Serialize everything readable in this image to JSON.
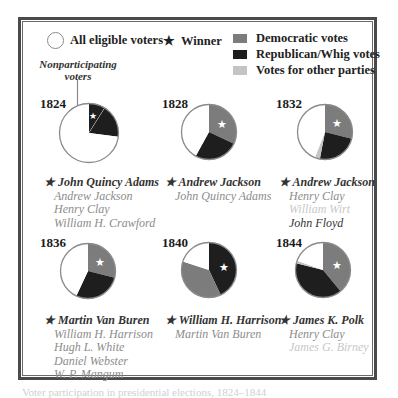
{
  "legend": {
    "eligible": "All eligible voters",
    "winner": "Winner",
    "democratic": "Democratic votes",
    "republican": "Republican/Whig votes",
    "other": "Votes for other parties"
  },
  "colors": {
    "democratic": "#7c7c7c",
    "republican": "#1e1e1e",
    "other": "#c4c4c4",
    "nonparticipating": "#ffffff",
    "outline": "#8a8a8a",
    "frame": "#4a4a4a"
  },
  "annotation": {
    "line1": "Nonparticipating",
    "line2": "voters"
  },
  "caption": "Voter participation in presidential elections, 1824–1844",
  "chart_data": {
    "type": "pie",
    "title": "",
    "legend": [
      "All eligible voters",
      "Winner",
      "Democratic votes",
      "Republican/Whig votes",
      "Votes for other parties"
    ],
    "charts": [
      {
        "year": "1824",
        "slices": [
          {
            "label": "Winner share (Adams)",
            "color": "republican",
            "value": 9
          },
          {
            "label": "Other candidates",
            "color": "republican",
            "value": 18
          },
          {
            "label": "Nonparticipating voters",
            "color": "nonparticipating",
            "value": 73
          }
        ],
        "candidates": [
          {
            "name": "John Quincy Adams",
            "winner": true
          },
          {
            "name": "Andrew Jackson",
            "winner": false
          },
          {
            "name": "Henry Clay",
            "winner": false
          },
          {
            "name": "William H. Crawford",
            "winner": false
          }
        ]
      },
      {
        "year": "1828",
        "slices": [
          {
            "label": "Democratic votes",
            "color": "democratic",
            "value": 32
          },
          {
            "label": "Republican/Whig votes",
            "color": "republican",
            "value": 26
          },
          {
            "label": "Nonparticipating voters",
            "color": "nonparticipating",
            "value": 42
          }
        ],
        "candidates": [
          {
            "name": "Andrew Jackson",
            "winner": true
          },
          {
            "name": "John Quincy Adams",
            "winner": false
          }
        ]
      },
      {
        "year": "1832",
        "slices": [
          {
            "label": "Democratic votes",
            "color": "democratic",
            "value": 29
          },
          {
            "label": "Republican/Whig votes",
            "color": "republican",
            "value": 24
          },
          {
            "label": "Votes for other parties",
            "color": "other",
            "value": 3
          },
          {
            "label": "Nonparticipating voters",
            "color": "nonparticipating",
            "value": 44
          }
        ],
        "candidates": [
          {
            "name": "Andrew Jackson",
            "winner": true
          },
          {
            "name": "Henry Clay",
            "winner": false
          },
          {
            "name": "William Wirt",
            "winner": false,
            "faint": true
          },
          {
            "name": "John Floyd",
            "winner": false,
            "dark": true
          }
        ]
      },
      {
        "year": "1836",
        "slices": [
          {
            "label": "Democratic votes",
            "color": "democratic",
            "value": 29
          },
          {
            "label": "Republican/Whig votes",
            "color": "republican",
            "value": 28
          },
          {
            "label": "Nonparticipating voters",
            "color": "nonparticipating",
            "value": 43
          }
        ],
        "candidates": [
          {
            "name": "Martin Van Buren",
            "winner": true
          },
          {
            "name": "William H. Harrison",
            "winner": false
          },
          {
            "name": "Hugh L. White",
            "winner": false
          },
          {
            "name": "Daniel Webster",
            "winner": false
          },
          {
            "name": "W. P. Mangum",
            "winner": false
          }
        ]
      },
      {
        "year": "1840",
        "slices": [
          {
            "label": "Republican/Whig votes",
            "color": "republican",
            "value": 43
          },
          {
            "label": "Democratic votes",
            "color": "democratic",
            "value": 37
          },
          {
            "label": "Nonparticipating voters",
            "color": "nonparticipating",
            "value": 20
          }
        ],
        "candidates": [
          {
            "name": "William H. Harrison",
            "winner": true
          },
          {
            "name": "Martin Van Buren",
            "winner": false
          }
        ]
      },
      {
        "year": "1844",
        "slices": [
          {
            "label": "Democratic votes",
            "color": "democratic",
            "value": 39
          },
          {
            "label": "Republican/Whig votes",
            "color": "republican",
            "value": 40
          },
          {
            "label": "Votes for other parties",
            "color": "other",
            "value": 1.5
          },
          {
            "label": "Nonparticipating voters",
            "color": "nonparticipating",
            "value": 19.5
          }
        ],
        "candidates": [
          {
            "name": "James K. Polk",
            "winner": true
          },
          {
            "name": "Henry Clay",
            "winner": false
          },
          {
            "name": "James G. Birney",
            "winner": false,
            "faint": true
          }
        ]
      }
    ]
  }
}
